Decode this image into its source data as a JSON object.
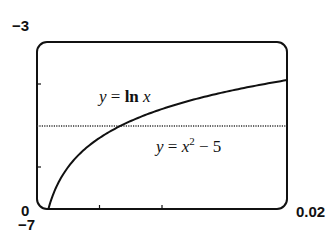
{
  "chart_data": {
    "type": "line",
    "title": "",
    "xlabel": "",
    "ylabel": "",
    "xlim": [
      0,
      0.02
    ],
    "ylim": [
      -7,
      -3
    ],
    "grid": false,
    "tick_labels": {
      "x_min": "0",
      "x_max": "0.02",
      "y_min": "−7",
      "y_max": "−3"
    },
    "x_ticks": [
      0.005,
      0.01
    ],
    "y_ticks": [
      -4,
      -6
    ],
    "series": [
      {
        "name": "y = ln x",
        "style": "solid",
        "x": [
          0.000912,
          0.001,
          0.002,
          0.003,
          0.004,
          0.005,
          0.006,
          0.008,
          0.01,
          0.012,
          0.014,
          0.016,
          0.018,
          0.02
        ],
        "y": [
          -7.0,
          -6.91,
          -6.21,
          -5.81,
          -5.52,
          -5.3,
          -5.12,
          -4.83,
          -4.61,
          -4.42,
          -4.27,
          -4.14,
          -4.02,
          -3.91
        ]
      },
      {
        "name": "y = x² − 5",
        "style": "dotted",
        "x": [
          0,
          0.02
        ],
        "y": [
          -5.0,
          -5.0004
        ]
      }
    ],
    "annotations": [
      {
        "text": "y = ln x",
        "near": "upper curve"
      },
      {
        "text": "y = x² − 5",
        "near": "horizontal line"
      }
    ]
  },
  "labels": {
    "y_max": "−3",
    "x_min": "0",
    "y_min": "−7",
    "x_max": "0.02",
    "ln_y": "y",
    "ln_eq": " = ",
    "ln_fn": "ln",
    "ln_x": " x",
    "par_y": "y",
    "par_eq": " = ",
    "par_x": "x",
    "par_exp": "2",
    "par_rest": " − 5"
  }
}
